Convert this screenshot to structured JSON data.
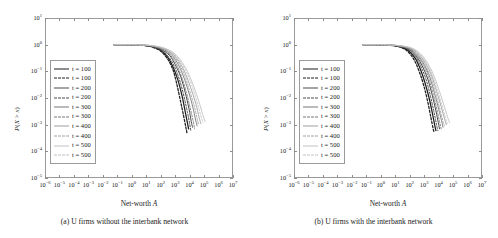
{
  "figure": {
    "panels": [
      {
        "id": "panel-a",
        "caption": "(a) U firms without the interbank network",
        "xlabel_prefix": "Net-worth ",
        "xlabel_symbol": "A",
        "ylabel": "P(X > x)"
      },
      {
        "id": "panel-b",
        "caption": "(b) U firms with the interbank network",
        "xlabel_prefix": "Net-worth ",
        "xlabel_symbol": "A",
        "ylabel": "P(X > x)"
      }
    ]
  },
  "axis": {
    "x_ticks": [
      "10-6",
      "10-5",
      "10-4",
      "10-3",
      "10-2",
      "10-1",
      "100",
      "101",
      "102",
      "103",
      "104",
      "105",
      "106",
      "107"
    ],
    "x_tick_mantissa": "10",
    "x_tick_exponents": [
      "-6",
      "-5",
      "-4",
      "-3",
      "-2",
      "-1",
      "0",
      "1",
      "2",
      "3",
      "4",
      "5",
      "6",
      "7"
    ],
    "y_tick_exponents": [
      "1",
      "0",
      "-1",
      "-2",
      "-3",
      "-4",
      "-5"
    ],
    "xlim_exp": [
      -6,
      7
    ],
    "ylim_exp": [
      -5,
      1
    ],
    "grid": false
  },
  "legend": {
    "position": "left-middle",
    "entries": [
      {
        "label": "t = 100",
        "style": "solid",
        "color": "#1d1d1d",
        "width": 1.25
      },
      {
        "label": "t = 100",
        "style": "dashed",
        "color": "#1d1d1d",
        "width": 1.25
      },
      {
        "label": "t = 200",
        "style": "solid",
        "color": "#4a4a4a",
        "width": 1.0
      },
      {
        "label": "t = 200",
        "style": "dashed",
        "color": "#4a4a4a",
        "width": 1.0
      },
      {
        "label": "t = 300",
        "style": "solid",
        "color": "#777777",
        "width": 0.9
      },
      {
        "label": "t = 300",
        "style": "dashed",
        "color": "#777777",
        "width": 0.9
      },
      {
        "label": "t = 400",
        "style": "solid",
        "color": "#a0a0a0",
        "width": 0.9
      },
      {
        "label": "t = 400",
        "style": "dashed",
        "color": "#a0a0a0",
        "width": 0.9
      },
      {
        "label": "t = 500",
        "style": "solid",
        "color": "#c2c2c2",
        "width": 0.9
      },
      {
        "label": "t = 500",
        "style": "dashed",
        "color": "#c2c2c2",
        "width": 0.9
      }
    ]
  },
  "chart_data": [
    {
      "type": "line",
      "title": "(a) U firms without the interbank network",
      "xlabel": "Net-worth A",
      "ylabel": "P(X > x)",
      "xscale": "log",
      "yscale": "log",
      "xlim": [
        1e-06,
        10000000.0
      ],
      "ylim": [
        1e-05,
        10
      ],
      "grid": false,
      "legend_position": "left-middle",
      "series": [
        {
          "name": "t = 100",
          "style": "solid",
          "color": "#1d1d1d",
          "x": [
            0.06,
            0.3,
            1,
            3,
            10,
            30,
            100,
            300,
            700,
            1500,
            3000,
            5000,
            7000,
            8500
          ],
          "y": [
            1.0,
            1.0,
            0.99,
            0.97,
            0.92,
            0.82,
            0.62,
            0.34,
            0.15,
            0.05,
            0.012,
            0.003,
            0.0012,
            0.0007
          ]
        },
        {
          "name": "t = 100",
          "style": "dashed",
          "color": "#1d1d1d",
          "x": [
            0.06,
            0.3,
            1,
            3,
            10,
            30,
            100,
            300,
            700,
            1200,
            2200,
            3800,
            5500,
            6500
          ],
          "y": [
            1.0,
            1.0,
            0.99,
            0.965,
            0.91,
            0.79,
            0.57,
            0.29,
            0.115,
            0.04,
            0.009,
            0.0022,
            0.0008,
            0.0005
          ]
        },
        {
          "name": "t = 200",
          "style": "solid",
          "color": "#4a4a4a",
          "x": [
            0.06,
            0.3,
            1,
            3,
            10,
            30,
            100,
            400,
            1000,
            2500,
            5000,
            9000,
            13000,
            16000
          ],
          "y": [
            1.0,
            1.0,
            0.99,
            0.975,
            0.93,
            0.85,
            0.67,
            0.4,
            0.18,
            0.06,
            0.016,
            0.004,
            0.0013,
            0.0008
          ]
        },
        {
          "name": "t = 200",
          "style": "dashed",
          "color": "#4a4a4a",
          "x": [
            0.06,
            0.3,
            1,
            3,
            10,
            30,
            100,
            350,
            900,
            2000,
            4000,
            7000,
            10000,
            12000
          ],
          "y": [
            1.0,
            1.0,
            0.99,
            0.97,
            0.92,
            0.83,
            0.63,
            0.35,
            0.15,
            0.048,
            0.012,
            0.003,
            0.0011,
            0.0006
          ]
        },
        {
          "name": "t = 300",
          "style": "solid",
          "color": "#777777",
          "x": [
            0.06,
            0.3,
            1,
            3,
            10,
            30,
            120,
            500,
            1400,
            3500,
            8000,
            16000,
            26000,
            33000
          ],
          "y": [
            1.0,
            1.0,
            0.995,
            0.98,
            0.945,
            0.87,
            0.7,
            0.44,
            0.21,
            0.072,
            0.019,
            0.005,
            0.0015,
            0.0009
          ]
        },
        {
          "name": "t = 300",
          "style": "dashed",
          "color": "#777777",
          "x": [
            0.06,
            0.3,
            1,
            3,
            10,
            30,
            110,
            450,
            1200,
            2800,
            6000,
            11000,
            18000,
            22000
          ],
          "y": [
            1.0,
            1.0,
            0.992,
            0.975,
            0.935,
            0.855,
            0.68,
            0.41,
            0.19,
            0.062,
            0.016,
            0.0042,
            0.0013,
            0.0007
          ]
        },
        {
          "name": "t = 400",
          "style": "solid",
          "color": "#a0a0a0",
          "x": [
            0.06,
            0.3,
            1,
            3,
            10,
            35,
            140,
            600,
            1800,
            5000,
            12000,
            26000,
            45000,
            60000
          ],
          "y": [
            1.0,
            1.0,
            0.995,
            0.982,
            0.955,
            0.885,
            0.73,
            0.48,
            0.24,
            0.085,
            0.024,
            0.0065,
            0.0019,
            0.0011
          ]
        },
        {
          "name": "t = 400",
          "style": "dashed",
          "color": "#a0a0a0",
          "x": [
            0.06,
            0.3,
            1,
            3,
            10,
            33,
            130,
            550,
            1600,
            4200,
            9500,
            20000,
            33000,
            42000
          ],
          "y": [
            1.0,
            1.0,
            0.994,
            0.98,
            0.95,
            0.875,
            0.72,
            0.46,
            0.225,
            0.078,
            0.021,
            0.0055,
            0.0017,
            0.001
          ]
        },
        {
          "name": "t = 500",
          "style": "solid",
          "color": "#c2c2c2",
          "x": [
            0.06,
            0.3,
            1,
            3,
            10,
            38,
            160,
            700,
            2300,
            7000,
            18000,
            42000,
            80000,
            120000
          ],
          "y": [
            1.0,
            1.0,
            0.996,
            0.985,
            0.962,
            0.9,
            0.76,
            0.52,
            0.27,
            0.1,
            0.03,
            0.008,
            0.0024,
            0.0013
          ]
        },
        {
          "name": "t = 500",
          "style": "dashed",
          "color": "#c2c2c2",
          "x": [
            0.06,
            0.3,
            1,
            3,
            10,
            36,
            150,
            650,
            2000,
            6000,
            15000,
            33000,
            60000,
            85000
          ],
          "y": [
            1.0,
            1.0,
            0.995,
            0.984,
            0.958,
            0.895,
            0.75,
            0.5,
            0.26,
            0.094,
            0.027,
            0.007,
            0.0021,
            0.0012
          ]
        }
      ]
    },
    {
      "type": "line",
      "title": "(b) U firms with the interbank network",
      "xlabel": "Net-worth A",
      "ylabel": "P(X > x)",
      "xscale": "log",
      "yscale": "log",
      "xlim": [
        1e-06,
        10000000.0
      ],
      "ylim": [
        1e-05,
        10
      ],
      "grid": false,
      "legend_position": "left-middle",
      "series": [
        {
          "name": "t = 100",
          "style": "solid",
          "color": "#1d1d1d",
          "x": [
            0.06,
            0.3,
            1,
            3,
            10,
            30,
            90,
            250,
            550,
            1100,
            2200,
            3800,
            5500,
            6500
          ],
          "y": [
            1.0,
            1.0,
            0.99,
            0.965,
            0.91,
            0.79,
            0.57,
            0.3,
            0.12,
            0.04,
            0.01,
            0.0025,
            0.0009,
            0.0006
          ]
        },
        {
          "name": "t = 100",
          "style": "dashed",
          "color": "#1d1d1d",
          "x": [
            0.06,
            0.3,
            1,
            3,
            10,
            28,
            80,
            210,
            450,
            900,
            1700,
            2900,
            4200,
            5000
          ],
          "y": [
            1.0,
            1.0,
            0.988,
            0.96,
            0.9,
            0.77,
            0.53,
            0.26,
            0.1,
            0.032,
            0.008,
            0.0019,
            0.0007,
            0.0005
          ]
        },
        {
          "name": "t = 200",
          "style": "solid",
          "color": "#4a4a4a",
          "x": [
            0.06,
            0.3,
            1,
            3,
            10,
            32,
            110,
            330,
            800,
            1800,
            3600,
            6500,
            9500,
            11500
          ],
          "y": [
            1.0,
            1.0,
            0.99,
            0.972,
            0.925,
            0.82,
            0.62,
            0.34,
            0.145,
            0.05,
            0.013,
            0.0033,
            0.0012,
            0.0007
          ]
        },
        {
          "name": "t = 200",
          "style": "dashed",
          "color": "#4a4a4a",
          "x": [
            0.06,
            0.3,
            1,
            3,
            10,
            30,
            100,
            290,
            680,
            1450,
            2800,
            4900,
            7200,
            8800
          ],
          "y": [
            1.0,
            1.0,
            0.989,
            0.97,
            0.918,
            0.81,
            0.6,
            0.32,
            0.13,
            0.044,
            0.011,
            0.0028,
            0.001,
            0.0006
          ]
        },
        {
          "name": "t = 300",
          "style": "solid",
          "color": "#777777",
          "x": [
            0.06,
            0.3,
            1,
            3,
            10,
            34,
            125,
            400,
            1050,
            2500,
            5200,
            10000,
            16000,
            20000
          ],
          "y": [
            1.0,
            1.0,
            0.992,
            0.977,
            0.935,
            0.845,
            0.66,
            0.38,
            0.17,
            0.058,
            0.015,
            0.0039,
            0.0014,
            0.0008
          ]
        },
        {
          "name": "t = 300",
          "style": "dashed",
          "color": "#777777",
          "x": [
            0.06,
            0.3,
            1,
            3,
            10,
            32,
            115,
            360,
            920,
            2100,
            4200,
            7800,
            12000,
            15000
          ],
          "y": [
            1.0,
            1.0,
            0.991,
            0.975,
            0.93,
            0.835,
            0.645,
            0.36,
            0.16,
            0.053,
            0.014,
            0.0035,
            0.0012,
            0.0007
          ]
        },
        {
          "name": "t = 400",
          "style": "solid",
          "color": "#a0a0a0",
          "x": [
            0.06,
            0.3,
            1,
            3,
            10,
            36,
            140,
            470,
            1300,
            3300,
            7200,
            15000,
            26000,
            34000
          ],
          "y": [
            1.0,
            1.0,
            0.993,
            0.98,
            0.945,
            0.865,
            0.7,
            0.42,
            0.195,
            0.068,
            0.018,
            0.0048,
            0.0016,
            0.001
          ]
        },
        {
          "name": "t = 400",
          "style": "dashed",
          "color": "#a0a0a0",
          "x": [
            0.06,
            0.3,
            1,
            3,
            10,
            35,
            132,
            430,
            1150,
            2800,
            5800,
            11500,
            19000,
            25000
          ],
          "y": [
            1.0,
            1.0,
            0.992,
            0.979,
            0.94,
            0.86,
            0.69,
            0.4,
            0.185,
            0.063,
            0.017,
            0.0044,
            0.0015,
            0.0009
          ]
        },
        {
          "name": "t = 500",
          "style": "solid",
          "color": "#c2c2c2",
          "x": [
            0.06,
            0.3,
            1,
            3,
            10,
            38,
            155,
            550,
            1600,
            4300,
            10000,
            22000,
            42000,
            58000
          ],
          "y": [
            1.0,
            1.0,
            0.994,
            0.982,
            0.952,
            0.88,
            0.73,
            0.46,
            0.22,
            0.078,
            0.022,
            0.006,
            0.0019,
            0.0012
          ]
        },
        {
          "name": "t = 500",
          "style": "dashed",
          "color": "#c2c2c2",
          "x": [
            0.06,
            0.3,
            1,
            3,
            10,
            37,
            148,
            510,
            1450,
            3700,
            8200,
            17000,
            30000,
            40000
          ],
          "y": [
            1.0,
            1.0,
            0.993,
            0.981,
            0.948,
            0.875,
            0.72,
            0.44,
            0.21,
            0.073,
            0.02,
            0.0054,
            0.0018,
            0.0011
          ]
        }
      ]
    }
  ]
}
